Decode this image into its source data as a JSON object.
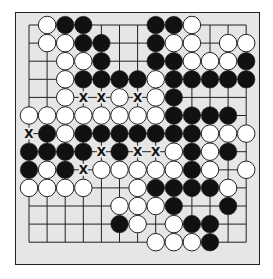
{
  "diagram": {
    "type": "go-board-partial",
    "grid": {
      "cols": 13,
      "rows": 13,
      "origin_x": 29,
      "origin_y": 25,
      "spacing": 18.1
    },
    "colors": {
      "board": "#e6e6e6",
      "line": "#222222",
      "black_stone": "#111111",
      "white_stone": "#ffffff",
      "stone_outline": "#222222"
    },
    "marker_label": "X",
    "stones": [
      {
        "r": 0,
        "c": 1,
        "color": "W"
      },
      {
        "r": 0,
        "c": 2,
        "color": "B"
      },
      {
        "r": 0,
        "c": 3,
        "color": "B"
      },
      {
        "r": 0,
        "c": 7,
        "color": "B"
      },
      {
        "r": 0,
        "c": 8,
        "color": "B"
      },
      {
        "r": 0,
        "c": 9,
        "color": "W"
      },
      {
        "r": 1,
        "c": 1,
        "color": "W"
      },
      {
        "r": 1,
        "c": 2,
        "color": "W"
      },
      {
        "r": 1,
        "c": 3,
        "color": "B"
      },
      {
        "r": 1,
        "c": 4,
        "color": "B"
      },
      {
        "r": 1,
        "c": 7,
        "color": "B"
      },
      {
        "r": 1,
        "c": 8,
        "color": "W"
      },
      {
        "r": 1,
        "c": 9,
        "color": "W"
      },
      {
        "r": 1,
        "c": 11,
        "color": "W"
      },
      {
        "r": 1,
        "c": 12,
        "color": "W"
      },
      {
        "r": 2,
        "c": 2,
        "color": "W"
      },
      {
        "r": 2,
        "c": 3,
        "color": "W"
      },
      {
        "r": 2,
        "c": 4,
        "color": "B"
      },
      {
        "r": 2,
        "c": 7,
        "color": "B"
      },
      {
        "r": 2,
        "c": 8,
        "color": "B"
      },
      {
        "r": 2,
        "c": 9,
        "color": "W"
      },
      {
        "r": 2,
        "c": 10,
        "color": "W"
      },
      {
        "r": 2,
        "c": 11,
        "color": "W"
      },
      {
        "r": 2,
        "c": 12,
        "color": "B"
      },
      {
        "r": 3,
        "c": 2,
        "color": "W"
      },
      {
        "r": 3,
        "c": 3,
        "color": "B"
      },
      {
        "r": 3,
        "c": 4,
        "color": "B"
      },
      {
        "r": 3,
        "c": 5,
        "color": "B"
      },
      {
        "r": 3,
        "c": 6,
        "color": "B"
      },
      {
        "r": 3,
        "c": 7,
        "color": "W"
      },
      {
        "r": 3,
        "c": 8,
        "color": "B"
      },
      {
        "r": 3,
        "c": 9,
        "color": "B"
      },
      {
        "r": 3,
        "c": 10,
        "color": "B"
      },
      {
        "r": 3,
        "c": 11,
        "color": "B"
      },
      {
        "r": 3,
        "c": 12,
        "color": "B"
      },
      {
        "r": 4,
        "c": 2,
        "color": "W"
      },
      {
        "r": 4,
        "c": 5,
        "color": "W"
      },
      {
        "r": 4,
        "c": 7,
        "color": "W"
      },
      {
        "r": 4,
        "c": 8,
        "color": "B"
      },
      {
        "r": 5,
        "c": 0,
        "color": "W"
      },
      {
        "r": 5,
        "c": 1,
        "color": "W"
      },
      {
        "r": 5,
        "c": 2,
        "color": "W"
      },
      {
        "r": 5,
        "c": 3,
        "color": "W"
      },
      {
        "r": 5,
        "c": 4,
        "color": "W"
      },
      {
        "r": 5,
        "c": 5,
        "color": "W"
      },
      {
        "r": 5,
        "c": 6,
        "color": "W"
      },
      {
        "r": 5,
        "c": 7,
        "color": "W"
      },
      {
        "r": 5,
        "c": 8,
        "color": "B"
      },
      {
        "r": 5,
        "c": 9,
        "color": "B"
      },
      {
        "r": 5,
        "c": 10,
        "color": "B"
      },
      {
        "r": 5,
        "c": 11,
        "color": "B"
      },
      {
        "r": 6,
        "c": 1,
        "color": "B"
      },
      {
        "r": 6,
        "c": 2,
        "color": "W"
      },
      {
        "r": 6,
        "c": 3,
        "color": "B"
      },
      {
        "r": 6,
        "c": 4,
        "color": "B"
      },
      {
        "r": 6,
        "c": 5,
        "color": "B"
      },
      {
        "r": 6,
        "c": 6,
        "color": "B"
      },
      {
        "r": 6,
        "c": 7,
        "color": "B"
      },
      {
        "r": 6,
        "c": 8,
        "color": "B"
      },
      {
        "r": 6,
        "c": 9,
        "color": "B"
      },
      {
        "r": 6,
        "c": 10,
        "color": "W"
      },
      {
        "r": 6,
        "c": 11,
        "color": "W"
      },
      {
        "r": 6,
        "c": 12,
        "color": "W"
      },
      {
        "r": 7,
        "c": 0,
        "color": "B"
      },
      {
        "r": 7,
        "c": 1,
        "color": "B"
      },
      {
        "r": 7,
        "c": 2,
        "color": "B"
      },
      {
        "r": 7,
        "c": 3,
        "color": "B"
      },
      {
        "r": 7,
        "c": 5,
        "color": "B"
      },
      {
        "r": 7,
        "c": 8,
        "color": "W"
      },
      {
        "r": 7,
        "c": 9,
        "color": "B"
      },
      {
        "r": 7,
        "c": 10,
        "color": "W"
      },
      {
        "r": 7,
        "c": 11,
        "color": "B"
      },
      {
        "r": 8,
        "c": 0,
        "color": "B"
      },
      {
        "r": 8,
        "c": 1,
        "color": "W"
      },
      {
        "r": 8,
        "c": 2,
        "color": "B"
      },
      {
        "r": 8,
        "c": 4,
        "color": "W"
      },
      {
        "r": 8,
        "c": 5,
        "color": "W"
      },
      {
        "r": 8,
        "c": 6,
        "color": "W"
      },
      {
        "r": 8,
        "c": 7,
        "color": "W"
      },
      {
        "r": 8,
        "c": 8,
        "color": "W"
      },
      {
        "r": 8,
        "c": 9,
        "color": "B"
      },
      {
        "r": 8,
        "c": 10,
        "color": "W"
      },
      {
        "r": 8,
        "c": 12,
        "color": "W"
      },
      {
        "r": 9,
        "c": 0,
        "color": "W"
      },
      {
        "r": 9,
        "c": 1,
        "color": "W"
      },
      {
        "r": 9,
        "c": 2,
        "color": "W"
      },
      {
        "r": 9,
        "c": 3,
        "color": "W"
      },
      {
        "r": 9,
        "c": 6,
        "color": "W"
      },
      {
        "r": 9,
        "c": 7,
        "color": "B"
      },
      {
        "r": 9,
        "c": 8,
        "color": "B"
      },
      {
        "r": 9,
        "c": 9,
        "color": "B"
      },
      {
        "r": 9,
        "c": 10,
        "color": "B"
      },
      {
        "r": 9,
        "c": 11,
        "color": "W"
      },
      {
        "r": 10,
        "c": 5,
        "color": "W"
      },
      {
        "r": 10,
        "c": 6,
        "color": "W"
      },
      {
        "r": 10,
        "c": 7,
        "color": "W"
      },
      {
        "r": 10,
        "c": 8,
        "color": "B"
      },
      {
        "r": 10,
        "c": 11,
        "color": "B"
      },
      {
        "r": 11,
        "c": 5,
        "color": "B"
      },
      {
        "r": 11,
        "c": 6,
        "color": "W"
      },
      {
        "r": 11,
        "c": 8,
        "color": "W"
      },
      {
        "r": 11,
        "c": 9,
        "color": "B"
      },
      {
        "r": 11,
        "c": 10,
        "color": "B"
      },
      {
        "r": 12,
        "c": 7,
        "color": "W"
      },
      {
        "r": 12,
        "c": 8,
        "color": "W"
      },
      {
        "r": 12,
        "c": 9,
        "color": "W"
      },
      {
        "r": 12,
        "c": 10,
        "color": "B"
      }
    ],
    "markers": [
      {
        "r": 4,
        "c": 3
      },
      {
        "r": 4,
        "c": 4
      },
      {
        "r": 4,
        "c": 6
      },
      {
        "r": 6,
        "c": 0
      },
      {
        "r": 7,
        "c": 4
      },
      {
        "r": 7,
        "c": 6
      },
      {
        "r": 7,
        "c": 7
      },
      {
        "r": 8,
        "c": 3
      }
    ]
  }
}
